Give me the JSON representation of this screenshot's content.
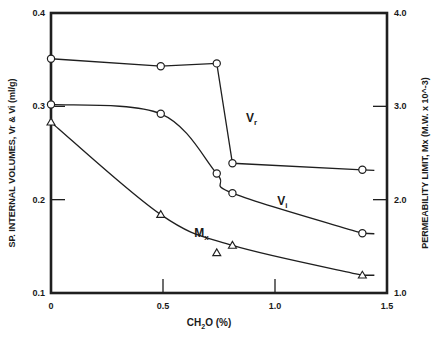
{
  "chart_data": {
    "type": "line",
    "title": "",
    "xlabel": "CH2O (%)",
    "xlabel_parts": {
      "main": "CH",
      "sub": "2",
      "rest": "O (%)"
    },
    "ylabel": "SP. INTERNAL VOLUMES, Vr & Vi (ml/g)",
    "y2label": "PERMEABILITY LIMIT, Mx (M.W. x 10^-3)",
    "xlim": [
      0,
      1.5
    ],
    "ylim": [
      0.1,
      0.4
    ],
    "y2lim": [
      1.0,
      4.0
    ],
    "xticks": [
      0,
      0.5,
      1.0,
      1.5
    ],
    "xtick_labels": [
      "0",
      "0.5",
      "1.0",
      "1.5"
    ],
    "yticks": [
      0.1,
      0.2,
      0.3,
      0.4
    ],
    "ytick_labels": [
      "0.1",
      "0.2",
      "0.3",
      "0.4"
    ],
    "y2ticks": [
      1.0,
      2.0,
      3.0,
      4.0
    ],
    "y2tick_labels": [
      "1.0",
      "2.0",
      "3.0",
      "4.0"
    ],
    "grid": false,
    "legend": "none (inline curve labels)",
    "series": [
      {
        "name": "Vr",
        "label": "V",
        "label_sub": "r",
        "axis": "left",
        "marker": "circle",
        "x": [
          0,
          0.49,
          0.74,
          0.81,
          1.39
        ],
        "y": [
          0.351,
          0.343,
          0.346,
          0.239,
          0.232
        ],
        "curve": "polyline",
        "label_pos": [
          0.87,
          0.283
        ]
      },
      {
        "name": "Vi",
        "label": "V",
        "label_sub": "i",
        "axis": "left",
        "marker": "circle",
        "x": [
          0,
          0.49,
          0.74,
          0.81,
          1.39
        ],
        "y": [
          0.302,
          0.292,
          0.228,
          0.207,
          0.164
        ],
        "curve": "smooth",
        "label_pos": [
          1.01,
          0.194
        ]
      },
      {
        "name": "Mx",
        "label": "M",
        "label_sub": "x",
        "axis": "right",
        "marker": "triangle",
        "x": [
          0,
          0.49,
          0.74,
          0.81,
          1.39
        ],
        "y": [
          2.83,
          1.84,
          1.43,
          1.51,
          1.19
        ],
        "curve": "smooth",
        "label_pos": [
          0.64,
          1.6
        ]
      }
    ],
    "annotations": [
      "Vr",
      "Vi",
      "Mx"
    ]
  }
}
